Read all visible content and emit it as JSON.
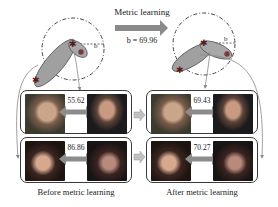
{
  "header": {
    "arrow_label": "Metric learning",
    "threshold_label": "b = 69.96",
    "radius_label_left": "b",
    "radius_label_right": "b"
  },
  "panels": {
    "before": {
      "caption": "Before metric learning",
      "pairs": [
        {
          "name": "male-pair",
          "distance": "55.62"
        },
        {
          "name": "female-pair",
          "distance": "86.86"
        }
      ]
    },
    "after": {
      "caption": "After metric learning",
      "pairs": [
        {
          "name": "male-pair",
          "distance": "69.43"
        },
        {
          "name": "female-pair",
          "distance": "70.27"
        }
      ]
    }
  },
  "colors": {
    "ellipse_fill": "#9a9a9a",
    "ellipse_stroke": "#555555",
    "arrow_gray": "#8a8a8a",
    "double_arrow": "#8c8c8c",
    "panel_border": "#3a3a3a",
    "star_marker": "#6e2a2a",
    "circle_marker": "#7a3a3a"
  }
}
